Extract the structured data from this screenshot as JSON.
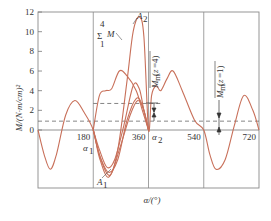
{
  "chart_data": {
    "type": "line",
    "title": "",
    "xlabel": "α/(°)",
    "ylabel": "M/(N·m/cm)²",
    "xlim": [
      0,
      720
    ],
    "ylim": [
      -6,
      12
    ],
    "x_ticks": [
      180,
      360,
      540,
      720
    ],
    "x_tick_labels": [
      "180",
      "360",
      "540",
      "720"
    ],
    "y_ticks": [
      0,
      2,
      4,
      6,
      8,
      10,
      12
    ],
    "y_tick_labels": [
      "0",
      "2",
      "4",
      "6",
      "8",
      "10",
      "12"
    ],
    "grid": false,
    "vertical_lines": [
      180,
      360,
      540
    ],
    "dashed_lines": [
      {
        "name": "upper-dashed",
        "y": 2.7,
        "x_range": [
          180,
          400
        ]
      },
      {
        "name": "lower-dashed",
        "y": 0.9,
        "x_range": [
          0,
          720
        ]
      }
    ],
    "annotations": [
      {
        "text": "ΣM (1..4)",
        "label_sum_top": "4",
        "label_sum_bottom": "1",
        "symbol": "Σ",
        "var": "M",
        "x": 255,
        "y": 10.5
      },
      {
        "text": "A2",
        "x": 330,
        "y": 11.5
      },
      {
        "text": "A1",
        "x": 225,
        "y": -5.3
      },
      {
        "text": "α1",
        "x": 180,
        "y": -0.6
      },
      {
        "text": "α2",
        "x": 360,
        "y": -0.6
      },
      {
        "text": "Mm(z=4)",
        "x": 375,
        "y": 6.5
      },
      {
        "text": "Mm(z=1)",
        "x": 555,
        "y": 3.5
      }
    ],
    "series": [
      {
        "name": "ΣM (summed, z=4)",
        "x": [
          0,
          20,
          40,
          60,
          90,
          120,
          150,
          180,
          200,
          230,
          260,
          290,
          310,
          330,
          345,
          360,
          370,
          385,
          400,
          420,
          440,
          470,
          510,
          540,
          560,
          580,
          610,
          640,
          670,
          700,
          720
        ],
        "y": [
          0,
          -2.5,
          -4.0,
          -2.5,
          1.5,
          3.0,
          1.8,
          0,
          -2.8,
          -4.8,
          -2.0,
          5.0,
          10.0,
          11.5,
          9.5,
          0,
          3.5,
          4.5,
          4.0,
          5.2,
          6.0,
          4.0,
          1.0,
          0,
          -2.5,
          -4.0,
          -3.0,
          0.5,
          3.5,
          2.0,
          0
        ]
      },
      {
        "name": "M1",
        "x": [
          180,
          200,
          220,
          240,
          265,
          290,
          320,
          340,
          360
        ],
        "y": [
          0,
          3.5,
          4.0,
          4.2,
          6.0,
          5.5,
          4.0,
          2.0,
          0
        ]
      },
      {
        "name": "M2",
        "x": [
          180,
          200,
          225,
          250,
          280,
          310,
          330,
          345,
          360
        ],
        "y": [
          0,
          -2.0,
          -3.8,
          -3.0,
          0.5,
          4.5,
          4.2,
          2.0,
          0
        ]
      },
      {
        "name": "M3",
        "x": [
          180,
          200,
          230,
          260,
          290,
          320,
          340,
          360
        ],
        "y": [
          0,
          -2.5,
          -4.3,
          -3.0,
          1.0,
          3.2,
          2.5,
          0
        ]
      },
      {
        "name": "M4",
        "x": [
          180,
          205,
          235,
          265,
          300,
          325,
          345,
          360
        ],
        "y": [
          0,
          -3.0,
          -4.6,
          -2.0,
          1.5,
          3.0,
          2.0,
          0
        ]
      }
    ],
    "colors": {
      "curve": "#c8705a",
      "axis": "#777777",
      "dashed": "#666666"
    }
  }
}
